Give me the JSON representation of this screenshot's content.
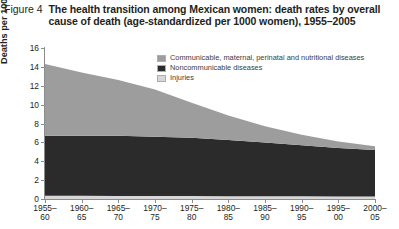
{
  "caption": {
    "figure_label": "Figure 4",
    "title": "The health transition among Mexican women: death rates by overall cause of death (age-standardized per 1000 women), 1955–2005"
  },
  "legend": {
    "position": "inside-top-center",
    "items": [
      {
        "label": "Communicable, maternal, perinatal and nutritional diseases",
        "color": "#9d9d9d"
      },
      {
        "label": "Noncommunicable diseases",
        "color": "#2b2b2b"
      },
      {
        "label": "Injuries",
        "color": "#d7d7d7"
      }
    ]
  },
  "axes": {
    "ylabel": "Deaths per 1000 women",
    "yticks": [
      0,
      2,
      4,
      6,
      8,
      10,
      12,
      14,
      16
    ],
    "xlabel": ""
  },
  "chart_data": {
    "type": "area",
    "stacked": true,
    "title": "The health transition among Mexican women: death rates by overall cause of death (age-standardized per 1000 women), 1955–2005",
    "xlabel": "",
    "ylabel": "Deaths per 1000 women",
    "ylim": [
      0,
      16
    ],
    "yticks": [
      0,
      2,
      4,
      6,
      8,
      10,
      12,
      14,
      16
    ],
    "grid": false,
    "legend_position": "inside-top-center",
    "categories": [
      "1955–60",
      "1960–65",
      "1965–70",
      "1970–75",
      "1975–80",
      "1980–85",
      "1985–90",
      "1990–95",
      "1995–00",
      "2000–05"
    ],
    "category_lines": [
      [
        "1955–",
        "60"
      ],
      [
        "1960–",
        "65"
      ],
      [
        "1965–",
        "70"
      ],
      [
        "1970–",
        "75"
      ],
      [
        "1975–",
        "80"
      ],
      [
        "1980–",
        "85"
      ],
      [
        "1985–",
        "90"
      ],
      [
        "1990–",
        "95"
      ],
      [
        "1995–",
        "00"
      ],
      [
        "2000–",
        "05"
      ]
    ],
    "series": [
      {
        "name": "Injuries",
        "color": "#d7d7d7",
        "values": [
          0.35,
          0.34,
          0.33,
          0.32,
          0.31,
          0.3,
          0.29,
          0.28,
          0.27,
          0.26
        ]
      },
      {
        "name": "Noncommunicable diseases",
        "color": "#2b2b2b",
        "values": [
          6.35,
          6.36,
          6.37,
          6.28,
          6.19,
          5.95,
          5.7,
          5.42,
          5.13,
          4.94
        ]
      },
      {
        "name": "Communicable, maternal, perinatal and nutritional diseases",
        "color": "#9d9d9d",
        "values": [
          7.6,
          6.7,
          5.9,
          5.0,
          3.7,
          2.6,
          1.71,
          1.1,
          0.7,
          0.4
        ]
      }
    ],
    "totals": [
      14.3,
      13.4,
      12.6,
      11.6,
      10.2,
      8.85,
      7.7,
      6.8,
      6.1,
      5.6
    ]
  }
}
